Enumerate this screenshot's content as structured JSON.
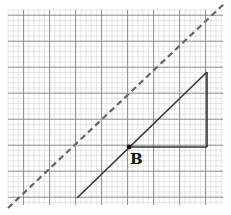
{
  "diagram": {
    "type": "graph-paper-geometry",
    "grid": {
      "x0": 8,
      "y0": 10,
      "x1": 223,
      "y1": 205,
      "minor_step": 5.2,
      "major_every": 5,
      "minor_color": "#d4d4d4",
      "major_color": "#8a8a8a"
    },
    "dashed_line": {
      "x1": 8,
      "y1": 208,
      "x2": 226,
      "y2": 2,
      "color": "#666666"
    },
    "solid_line": {
      "x1": 77,
      "y1": 198,
      "x2": 207,
      "y2": 72,
      "color": "#333333"
    },
    "triangle_legs": {
      "vertical": {
        "x": 207,
        "y1": 72,
        "y2": 147
      },
      "horizontal": {
        "y": 147,
        "x1": 129,
        "x2": 207
      }
    },
    "point": {
      "name": "B",
      "x": 129,
      "y": 147
    },
    "labels": {
      "point_b": "B"
    }
  }
}
